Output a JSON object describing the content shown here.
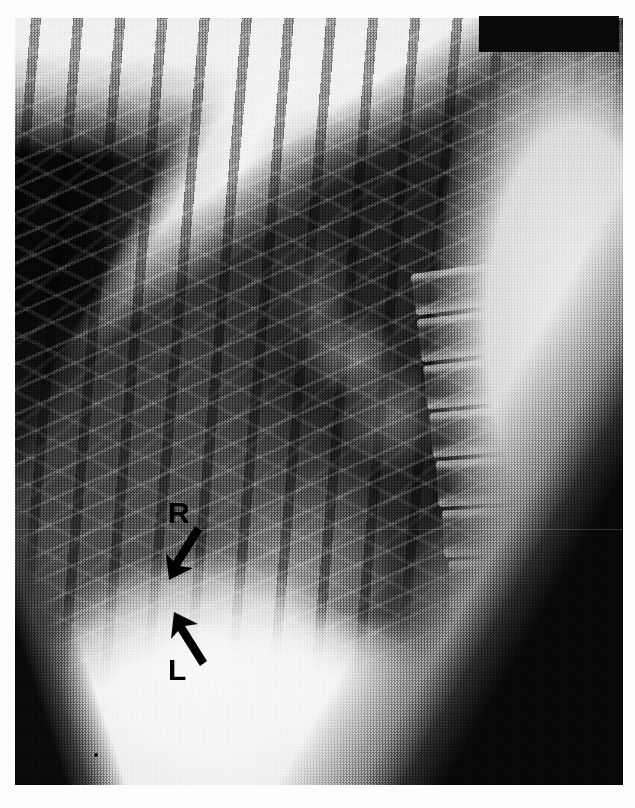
{
  "image": {
    "kind": "radiograph",
    "modality": "X-ray",
    "view": "lateral chest",
    "title": "Lateral chest radiograph",
    "background_color": "#ffffff",
    "film_color": "#0a0a0a",
    "annotation_color": "#000000"
  },
  "redaction": {
    "name": "patient-identifier-redaction",
    "visible": true,
    "color": "#090909"
  },
  "annotations": [
    {
      "id": "marker-r",
      "label": "R",
      "meaning": "right hemidiaphragm",
      "arrow_direction": "down-left",
      "letter_x": 168,
      "letter_y": 498,
      "color": "#000000"
    },
    {
      "id": "marker-l",
      "label": "L",
      "meaning": "left hemidiaphragm",
      "arrow_direction": "up-right",
      "letter_x": 168,
      "letter_y": 655,
      "color": "#000000"
    }
  ],
  "anatomy": {
    "regions": [
      "anterior chest wall",
      "retrosternal lung field",
      "thoracic vertebral bodies",
      "posterior ribs",
      "hilar vessels",
      "right hemidiaphragm",
      "left hemidiaphragm",
      "posterior costophrenic angle",
      "sub-diaphragmatic abdomen"
    ],
    "vertebrae_count": 9
  }
}
